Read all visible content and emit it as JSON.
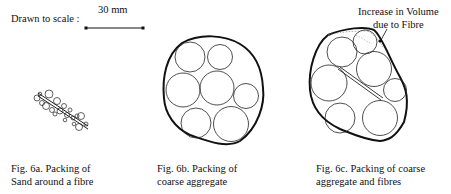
{
  "scale": {
    "label": "Drawn to scale :",
    "value": "30 mm"
  },
  "figures": [
    {
      "id": "6a",
      "caption_line1": "Fig. 6a.  Packing of",
      "caption_line2": "Sand around a fibre"
    },
    {
      "id": "6b",
      "caption_line1": "Fig. 6b.  Packing of",
      "caption_line2": "coarse aggregate"
    },
    {
      "id": "6c",
      "caption_line1": "Fig. 6c.  Packing of coarse",
      "caption_line2": "aggregate and fibres"
    }
  ],
  "annotation": {
    "line1": "Increase in Volume",
    "line2": "due to Fibre"
  }
}
